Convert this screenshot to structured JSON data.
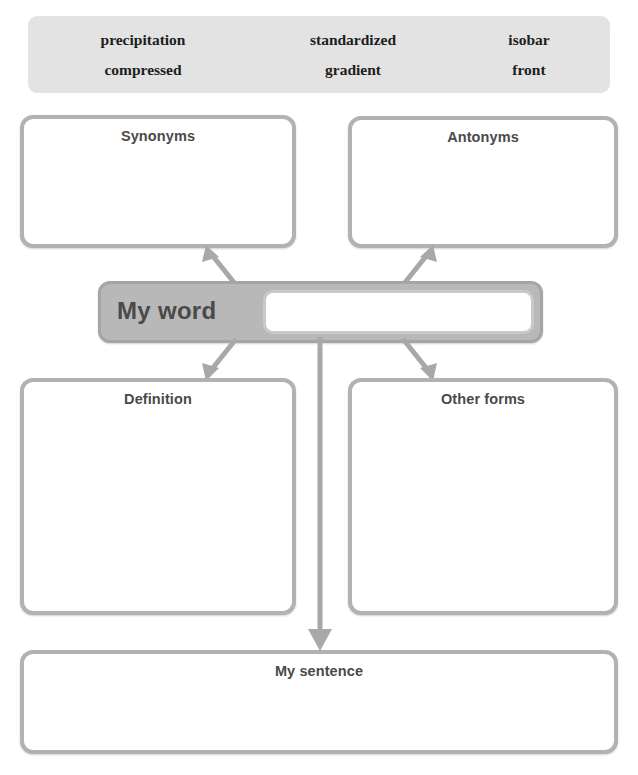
{
  "worksheet": {
    "word_bank": {
      "rows": [
        [
          "precipitation",
          "standardized",
          "isobar"
        ],
        [
          "compressed",
          "gradient",
          "front"
        ]
      ]
    },
    "center": {
      "label": "My word",
      "input_value": "",
      "input_placeholder": ""
    },
    "boxes": {
      "synonyms": {
        "title": "Synonyms",
        "content": ""
      },
      "antonyms": {
        "title": "Antonyms",
        "content": ""
      },
      "definition": {
        "title": "Definition",
        "content": ""
      },
      "other_forms": {
        "title": "Other forms",
        "content": ""
      },
      "sentence": {
        "title": "My sentence",
        "content": ""
      }
    },
    "colors": {
      "word_bank_fill": "#e3e3e3",
      "card_border": "#b2b2b2",
      "center_fill": "#b8b8b8",
      "arrow": "#a8a8a8",
      "title_text": "#4a4a4a"
    }
  }
}
